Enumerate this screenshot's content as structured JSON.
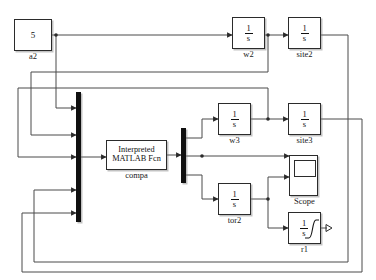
{
  "diagram": {
    "canvas": {
      "width": 376,
      "height": 280,
      "background": "#ffffff"
    },
    "line_color": "#4a4a4a",
    "block_border_color": "#2b2b2b",
    "mux_color": "#101010"
  },
  "blocks": {
    "constant_a2": {
      "value": "5",
      "label": "a2",
      "type": "constant",
      "x": 14,
      "y": 19,
      "w": 38,
      "h": 32
    },
    "integrator_w2": {
      "numerator": "1",
      "denominator": "s",
      "label": "w2",
      "type": "integrator",
      "x": 232,
      "y": 17,
      "w": 33,
      "h": 32
    },
    "integrator_site2": {
      "numerator": "1",
      "denominator": "s",
      "label": "site2",
      "type": "integrator",
      "x": 288,
      "y": 17,
      "w": 33,
      "h": 32
    },
    "integrator_w3": {
      "numerator": "1",
      "denominator": "s",
      "label": "w3",
      "type": "integrator",
      "x": 218,
      "y": 103,
      "w": 33,
      "h": 32
    },
    "integrator_site3": {
      "numerator": "1",
      "denominator": "s",
      "label": "site3",
      "type": "integrator",
      "x": 288,
      "y": 103,
      "w": 33,
      "h": 32
    },
    "integrator_tor2": {
      "numerator": "1",
      "denominator": "s",
      "label": "tor2",
      "type": "integrator",
      "x": 218,
      "y": 183,
      "w": 33,
      "h": 32
    },
    "saturating_integrator_r1": {
      "numerator": "1",
      "denominator": "s",
      "label": "r1",
      "type": "saturating-integrator",
      "x": 288,
      "y": 212,
      "w": 33,
      "h": 32
    },
    "matlab_fcn": {
      "line1": "Interpreted",
      "line2": "MATLAB Fcn",
      "label": "compa",
      "type": "interpreted-matlab-function",
      "x": 106,
      "y": 140,
      "w": 61,
      "h": 30
    },
    "scope": {
      "label": "Scope",
      "type": "scope",
      "x": 289,
      "y": 155,
      "w": 29,
      "h": 41
    },
    "mux_input": {
      "type": "mux",
      "inputs": 5,
      "x": 76,
      "y": 92,
      "w": 5,
      "h": 130
    },
    "demux_output": {
      "type": "demux",
      "outputs": 3,
      "x": 181,
      "y": 128,
      "w": 5,
      "h": 55
    }
  },
  "icons": {
    "integral_sign": "integral-icon",
    "saturation_curve": "saturation-curve-icon",
    "scope_display": "scope-screen-icon"
  }
}
